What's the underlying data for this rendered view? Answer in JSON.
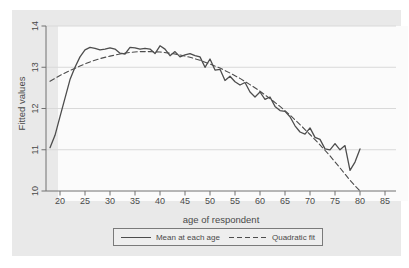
{
  "figure": {
    "kind": "stata-style line chart (scanned grayscale)"
  },
  "colors": {
    "figure_background": "#e9e9e9",
    "plot_background": "#fbfbfb",
    "gridline": "#d9d9d9",
    "axis_line": "#707070",
    "series_line": "#4d4d4d",
    "text": "#4a4a4a"
  },
  "legend": {
    "items": [
      {
        "label": "Mean at each age",
        "style": "solid"
      },
      {
        "label": "Quadratic fit",
        "style": "dashed"
      }
    ]
  },
  "chart_data": {
    "type": "line",
    "title": "",
    "xlabel": "age of respondent",
    "ylabel": "Fitted values",
    "xlim": [
      17.2,
      87.2
    ],
    "ylim": [
      10,
      14
    ],
    "x_ticks": [
      20,
      25,
      30,
      35,
      40,
      45,
      50,
      55,
      60,
      65,
      70,
      75,
      80,
      85
    ],
    "y_ticks": [
      10,
      11,
      12,
      13,
      14
    ],
    "grid": "horizontal gridlines at labeled y ticks",
    "legend_position": "bottom-center boxed",
    "series": [
      {
        "name": "Mean at each age",
        "style": "solid",
        "x": [
          18,
          19,
          20,
          21,
          22,
          23,
          24,
          25,
          26,
          27,
          28,
          29,
          30,
          31,
          32,
          33,
          34,
          35,
          36,
          37,
          38,
          39,
          40,
          41,
          42,
          43,
          44,
          45,
          46,
          47,
          48,
          49,
          50,
          51,
          52,
          53,
          54,
          55,
          56,
          57,
          58,
          59,
          60,
          61,
          62,
          63,
          64,
          65,
          66,
          67,
          68,
          69,
          70,
          71,
          72,
          73,
          74,
          75,
          76,
          77,
          78,
          79,
          80
        ],
        "values": [
          11.05,
          11.35,
          11.8,
          12.25,
          12.7,
          13.0,
          13.25,
          13.42,
          13.48,
          13.46,
          13.42,
          13.44,
          13.47,
          13.44,
          13.34,
          13.32,
          13.48,
          13.47,
          13.44,
          13.46,
          13.44,
          13.33,
          13.52,
          13.44,
          13.28,
          13.38,
          13.25,
          13.3,
          13.33,
          13.28,
          13.25,
          13.0,
          13.2,
          12.93,
          12.95,
          12.68,
          12.78,
          12.65,
          12.57,
          12.63,
          12.4,
          12.28,
          12.4,
          12.22,
          12.28,
          12.05,
          11.95,
          11.93,
          11.8,
          11.58,
          11.43,
          11.38,
          11.53,
          11.3,
          11.25,
          11.02,
          11.0,
          11.15,
          11.0,
          11.1,
          10.5,
          10.7,
          11.02
        ]
      },
      {
        "name": "Quadratic fit",
        "style": "dashed",
        "x": [
          18,
          20,
          22,
          24,
          26,
          28,
          30,
          32,
          34,
          36,
          38,
          40,
          42,
          44,
          46,
          48,
          50,
          52,
          54,
          56,
          58,
          60,
          62,
          64,
          66,
          68,
          70,
          72,
          74,
          76,
          78,
          80
        ],
        "values": [
          12.66,
          12.8,
          12.92,
          13.03,
          13.13,
          13.21,
          13.27,
          13.32,
          13.36,
          13.38,
          13.38,
          13.37,
          13.34,
          13.3,
          13.24,
          13.17,
          13.08,
          12.98,
          12.86,
          12.73,
          12.58,
          12.42,
          12.24,
          12.05,
          11.84,
          11.61,
          11.37,
          11.12,
          10.85,
          10.56,
          10.26,
          10.0
        ]
      }
    ]
  }
}
